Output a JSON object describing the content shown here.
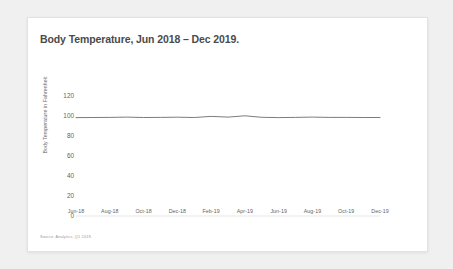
{
  "card": {
    "title": "Body Temperature, Jun 2018 – Dec 2019.",
    "source_note": "Source: Analytics, Q1 2019."
  },
  "chart_data": {
    "type": "line",
    "title": "Body Temperature, Jun 2018 – Dec 2019.",
    "xlabel": "",
    "ylabel": "Body Temperature in Fahrenheit",
    "ylim": [
      0,
      120
    ],
    "yticks": [
      120,
      100,
      80,
      60,
      40,
      20,
      0
    ],
    "grid": false,
    "legend": false,
    "line_color": "#595959",
    "categories": [
      "Jun-18",
      "Jul-18",
      "Aug-18",
      "Sep-18",
      "Oct-18",
      "Nov-18",
      "Dec-18",
      "Jan-19",
      "Feb-19",
      "Mar-19",
      "Apr-19",
      "May-19",
      "Jun-19",
      "Jul-19",
      "Aug-19",
      "Sep-19",
      "Oct-19",
      "Nov-19",
      "Dec-19"
    ],
    "tick_labels": [
      "Jun-18",
      "Aug-18",
      "Oct-18",
      "Dec-18",
      "Feb-19",
      "Apr-19",
      "Jun-19",
      "Aug-19",
      "Oct-19",
      "Dec-19"
    ],
    "series": [
      {
        "name": "Body Temperature",
        "values": [
          98.4,
          98.5,
          98.6,
          98.9,
          98.5,
          98.6,
          98.8,
          98.5,
          99.6,
          98.9,
          100.2,
          98.7,
          98.4,
          98.6,
          98.9,
          98.6,
          98.6,
          98.5,
          98.5
        ]
      }
    ]
  }
}
